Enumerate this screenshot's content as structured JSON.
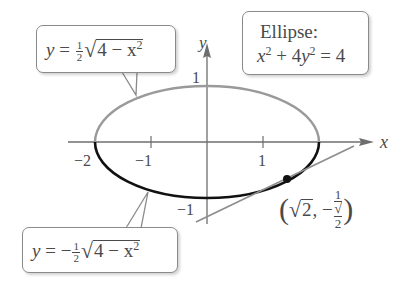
{
  "diagram": {
    "type": "ellipse-graph",
    "axes": {
      "x_label": "x",
      "y_label": "y",
      "x_ticks": [
        "−2",
        "−1",
        "1"
      ],
      "y_ticks": [
        "1",
        "−1"
      ]
    },
    "callouts": {
      "upper_half": {
        "lhs": "y",
        "eq": "=",
        "sign": "",
        "frac_num": "1",
        "frac_den": "2",
        "radicand": "4 − x",
        "exp": "2"
      },
      "lower_half": {
        "lhs": "y",
        "eq": "=",
        "sign": "−",
        "frac_num": "1",
        "frac_den": "2",
        "radicand": "4 − x",
        "exp": "2"
      },
      "ellipse": {
        "title": "Ellipse:",
        "eq_x": "x",
        "eq_x_exp": "2",
        "eq_mid": " + 4",
        "eq_y": "y",
        "eq_y_exp": "2",
        "eq_rhs": " = 4"
      }
    },
    "point": {
      "label_open": "(",
      "x_radicand": "2",
      "comma": ",",
      "sign": "−",
      "num": "1",
      "den_radicand": "2",
      "label_close": ")"
    },
    "colors": {
      "upper_curve": "#9a9a9a",
      "lower_curve": "#111111",
      "axes": "#6e6e6e",
      "tangent": "#8e8e8e",
      "text": "#4a4a4a"
    }
  }
}
